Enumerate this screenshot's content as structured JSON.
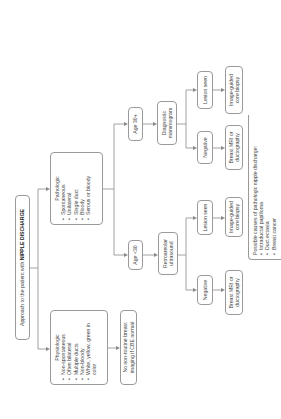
{
  "diagram": {
    "title_prefix": "Approach to the patient with ",
    "title_emphasis": "NIPPLE DISCHARGE",
    "physiologic": {
      "heading": "Physiologic",
      "items": [
        "Non-spontaneous",
        "Often bilateral",
        "Multiple ducts",
        "Non-bloody",
        "White, yellow, green in color"
      ]
    },
    "pathologic": {
      "heading": "Pathologic",
      "items": [
        "Spontaneous",
        "Unilateral",
        "Single duct",
        "Bloody",
        "Serous or bloody"
      ]
    },
    "no_imaging": "No non-routine breast imaging if CBE normal",
    "age_under_30": {
      "label": "Age <30",
      "test": "Retroareolar ultrasound",
      "negative": "Negative",
      "negative_next": "Breast MRI or ductography",
      "lesion": "Lesion seen",
      "lesion_next": "Image-guided core biopsy"
    },
    "age_30_plus": {
      "label": "Age 30+",
      "test": "Diagnostic mammogram",
      "negative": "Negative",
      "negative_next": "Breast MRI or ductography",
      "lesion": "Lesion seen",
      "lesion_next": "Image-guided core biopsy"
    },
    "causes": {
      "heading": "Possible causes of pathologic nipple discharge:",
      "items": [
        "Intraductal papilloma",
        "Duct ectasia",
        "Breast cancer"
      ]
    }
  }
}
